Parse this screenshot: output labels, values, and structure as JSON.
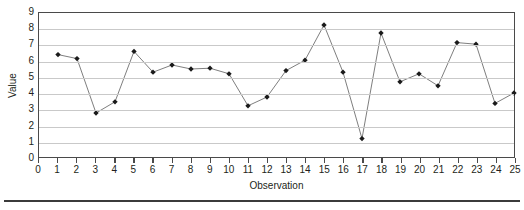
{
  "chart_data": {
    "type": "line",
    "title": "",
    "xlabel": "Observation",
    "ylabel": "Value",
    "xlim": [
      0,
      25
    ],
    "ylim": [
      0,
      9
    ],
    "grid": true,
    "legend": "none",
    "marker": "diamond",
    "marker_color": "#1a1a1a",
    "line_color": "#6e6e6e",
    "gridline_color": "#c9c9c9",
    "axis_color": "#4a4a4a",
    "x": [
      1,
      2,
      3,
      4,
      5,
      6,
      7,
      8,
      9,
      10,
      11,
      12,
      13,
      14,
      15,
      16,
      17,
      18,
      19,
      20,
      21,
      22,
      23,
      24,
      25
    ],
    "values": [
      6.4,
      6.15,
      2.75,
      3.45,
      6.6,
      5.3,
      5.75,
      5.5,
      5.55,
      5.2,
      3.2,
      3.75,
      5.4,
      6.05,
      8.25,
      5.3,
      1.15,
      7.75,
      4.7,
      5.2,
      4.45,
      7.15,
      7.05,
      3.35,
      4.0
    ],
    "series": [
      {
        "name": "Value",
        "values": [
          6.4,
          6.15,
          2.75,
          3.45,
          6.6,
          5.3,
          5.75,
          5.5,
          5.55,
          5.2,
          3.2,
          3.75,
          5.4,
          6.05,
          8.25,
          5.3,
          1.15,
          7.75,
          4.7,
          5.2,
          4.45,
          7.15,
          7.05,
          3.35,
          4.0
        ]
      }
    ],
    "xticks": [
      0,
      1,
      2,
      3,
      4,
      5,
      6,
      7,
      8,
      9,
      10,
      11,
      12,
      13,
      14,
      15,
      16,
      17,
      18,
      19,
      20,
      21,
      22,
      23,
      24,
      25
    ],
    "xticklabels": [
      "0",
      "1",
      "2",
      "3",
      "4",
      "5",
      "6",
      "7",
      "8",
      "9",
      "10",
      "11",
      "12",
      "13",
      "14",
      "15",
      "16",
      "17",
      "18",
      "19",
      "20",
      "21",
      "22",
      "23",
      "24",
      "25"
    ],
    "yticks": [
      0,
      1,
      2,
      3,
      4,
      5,
      6,
      7,
      8,
      9
    ],
    "yticklabels": [
      "0",
      "1",
      "2",
      "3",
      "4",
      "5",
      "6",
      "7",
      "8",
      "9"
    ]
  }
}
